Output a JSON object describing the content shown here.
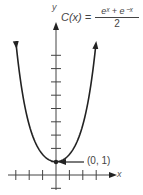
{
  "chart_data": {
    "type": "line",
    "function": "cosh(x)",
    "formula": {
      "lhs": "C(x) =",
      "numerator": "eˣ + e⁻ˣ",
      "denominator": "2"
    },
    "xlabel": "x",
    "ylabel": "y",
    "annotations": [
      {
        "text": "(0, 1)",
        "x": 0,
        "y": 1,
        "arrow": true
      }
    ],
    "x_ticks": [
      -3,
      -2,
      -1,
      1,
      2,
      3
    ],
    "y_ticks": [
      -1,
      1,
      2,
      3,
      4,
      5,
      6,
      7,
      8,
      9
    ],
    "xlim": [
      -3.2,
      4.2
    ],
    "ylim": [
      -1.5,
      10
    ],
    "x": [
      -2.97,
      -2.5,
      -2,
      -1.5,
      -1,
      -0.5,
      0,
      0.5,
      1,
      1.5,
      2,
      2.5,
      2.97
    ],
    "y": [
      9.78,
      6.13,
      3.76,
      2.35,
      1.54,
      1.13,
      1.0,
      1.13,
      1.54,
      2.35,
      3.76,
      6.13,
      9.78
    ],
    "grid": false,
    "legend": null
  }
}
